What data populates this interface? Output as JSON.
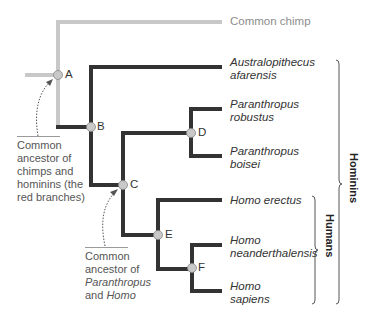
{
  "colors": {
    "chimp_branch": "#c8c8c8",
    "hominin_branch": "#333333",
    "node_fill": "#c9c9c9",
    "bracket": "#555555"
  },
  "taxa": [
    {
      "id": "chimp",
      "label": "Common chimp",
      "italic": false
    },
    {
      "id": "aafarensis",
      "line1": "Australopithecus",
      "line2": "afarensis"
    },
    {
      "id": "probustus",
      "line1": "Paranthropus",
      "line2": "robustus"
    },
    {
      "id": "pboisei",
      "line1": "Paranthropus",
      "line2": "boisei"
    },
    {
      "id": "herectus",
      "line1": "Homo erectus"
    },
    {
      "id": "hneanderthalensis",
      "line1": "Homo",
      "line2": "neanderthalensis"
    },
    {
      "id": "hsapiens",
      "line1": "Homo",
      "line2": "sapiens"
    }
  ],
  "nodes": {
    "A": "A",
    "B": "B",
    "C": "C",
    "D": "D",
    "E": "E",
    "F": "F"
  },
  "annotations": {
    "ancestor_chimps": {
      "l1": "Common",
      "l2": "ancestor of",
      "l3": "chimps and",
      "l4": "hominins (the",
      "l5": "red branches)"
    },
    "ancestor_paranthropus": {
      "l1": "Common",
      "l2": "ancestor of",
      "l3": "Paranthropus",
      "l4a": "and ",
      "l4b": "Homo"
    }
  },
  "clades": {
    "hominins": "Hominins",
    "humans": "Humans"
  }
}
